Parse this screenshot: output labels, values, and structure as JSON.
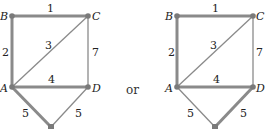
{
  "connector": "or",
  "graphs": [
    {
      "id": "left",
      "vertices": {
        "B": "B",
        "C": "C",
        "A": "A",
        "D": "D"
      },
      "edges": [
        {
          "from": "B",
          "to": "C",
          "weight": "1",
          "style": "thick"
        },
        {
          "from": "B",
          "to": "A",
          "weight": "2",
          "style": "thick"
        },
        {
          "from": "A",
          "to": "C",
          "weight": "3",
          "style": "thin"
        },
        {
          "from": "A",
          "to": "D",
          "weight": "4",
          "style": "thick"
        },
        {
          "from": "C",
          "to": "D",
          "weight": "7",
          "style": "thin"
        },
        {
          "from": "A",
          "to": "E",
          "weight": "5",
          "style": "thick"
        },
        {
          "from": "D",
          "to": "E",
          "weight": "5",
          "style": "thin"
        }
      ]
    },
    {
      "id": "right",
      "vertices": {
        "B": "B",
        "C": "C",
        "A": "A",
        "D": "D"
      },
      "edges": [
        {
          "from": "B",
          "to": "C",
          "weight": "1",
          "style": "thick"
        },
        {
          "from": "B",
          "to": "A",
          "weight": "2",
          "style": "thick"
        },
        {
          "from": "A",
          "to": "C",
          "weight": "3",
          "style": "thin"
        },
        {
          "from": "A",
          "to": "D",
          "weight": "4",
          "style": "thick"
        },
        {
          "from": "C",
          "to": "D",
          "weight": "7",
          "style": "thin"
        },
        {
          "from": "A",
          "to": "E",
          "weight": "5",
          "style": "thin"
        },
        {
          "from": "D",
          "to": "E",
          "weight": "5",
          "style": "thick"
        }
      ]
    }
  ]
}
